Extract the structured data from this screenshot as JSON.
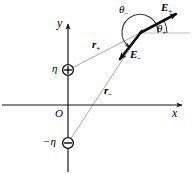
{
  "figure": {
    "type": "physics-vector-diagram",
    "width": 192,
    "height": 176,
    "background_color": "#ffffff",
    "ink_color": "#000000",
    "faint_line_color": "#b4b4b4"
  },
  "axes": {
    "x_label": "x",
    "y_label": "y",
    "origin_label": "O",
    "x_axis_y_px": 105,
    "y_axis_x_px": 68,
    "x_axis_from_px": 2,
    "x_axis_to_px": 186,
    "y_axis_from_px": 172,
    "y_axis_to_px": 18,
    "arrowheads": [
      "x-positive",
      "y-positive"
    ]
  },
  "charges": [
    {
      "name": "positive-charge",
      "label": "η",
      "sign": "+",
      "glyph": "⊕",
      "x_px": 68,
      "y_px": 70,
      "label_x_px": 52,
      "label_y_px": 63
    },
    {
      "name": "negative-charge",
      "label": "−η",
      "sign": "−",
      "glyph": "⊖",
      "x_px": 68,
      "y_px": 143,
      "label_x_px": 44,
      "label_y_px": 136
    }
  ],
  "field_point": {
    "name": "field-point",
    "x_px": 140,
    "y_px": 33
  },
  "position_vectors": [
    {
      "name": "r-plus",
      "label": "r",
      "subscript": "+",
      "from_x_px": 68,
      "from_y_px": 70,
      "to_x_px": 140,
      "to_y_px": 33,
      "label_x_px": 92,
      "label_y_px": 40
    },
    {
      "name": "r-minus",
      "label": "r",
      "subscript": "−",
      "from_x_px": 68,
      "from_y_px": 143,
      "to_x_px": 140,
      "to_y_px": 33,
      "label_x_px": 104,
      "label_y_px": 86
    }
  ],
  "field_vectors": [
    {
      "name": "E-plus",
      "label": "E",
      "subscript": "+",
      "from_x_px": 140,
      "from_y_px": 33,
      "to_x_px": 181,
      "to_y_px": 11,
      "label_x_px": 162,
      "label_y_px": 3
    },
    {
      "name": "E-minus",
      "label": "E",
      "subscript": "−",
      "from_x_px": 140,
      "from_y_px": 33,
      "to_x_px": 116,
      "to_y_px": 63,
      "label_x_px": 132,
      "label_y_px": 50
    }
  ],
  "angles": [
    {
      "name": "theta-plus",
      "label": "θ",
      "subscript": "+",
      "measured_from": "positive-x-reference",
      "measured_to": "E-plus",
      "approx_degrees": 28,
      "label_x_px": 158,
      "label_y_px": 24
    },
    {
      "name": "theta-minus",
      "label": "θ",
      "subscript": "−",
      "measured_from": "positive-x-reference",
      "measured_to": "E-minus",
      "approx_degrees": 231,
      "label_x_px": 120,
      "label_y_px": 6
    }
  ],
  "reference_line": {
    "name": "horizontal-reference-line",
    "from_x_px": 140,
    "from_y_px": 33,
    "to_x_px": 190,
    "to_y_px": 33
  }
}
